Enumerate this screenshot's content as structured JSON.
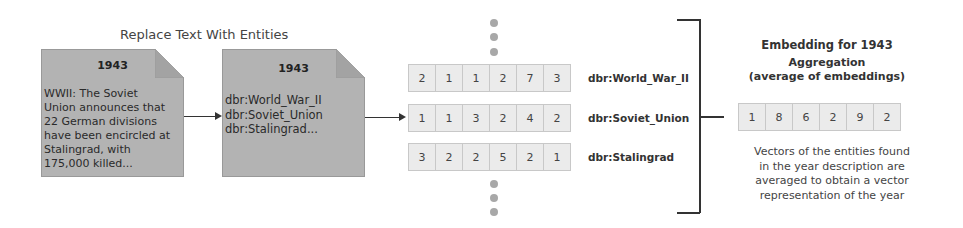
{
  "step1": {
    "title": "Replace Text With Entities",
    "source_doc": {
      "year": "1943",
      "text_lines": [
        "WWII: The Soviet",
        "Union announces that",
        "22 German divisions",
        "have been encircled at",
        "Stalingrad, with",
        "175,000 killed..."
      ]
    },
    "entity_doc": {
      "year": "1943",
      "entity_lines": [
        "dbr:World_War_II",
        "dbr:Soviet_Union",
        "dbr:Stalingrad..."
      ]
    }
  },
  "entity_vectors": [
    {
      "label": "dbr:World_War_II",
      "values": [
        2,
        1,
        1,
        2,
        7,
        3
      ]
    },
    {
      "label": "dbr:Soviet_Union",
      "values": [
        1,
        1,
        3,
        2,
        4,
        2
      ]
    },
    {
      "label": "dbr:Stalingrad",
      "values": [
        3,
        2,
        2,
        5,
        2,
        1
      ]
    }
  ],
  "ellipsis_top": "⋮",
  "ellipsis_bottom": "⋮",
  "aggregation": {
    "title_line1": "Embedding for 1943",
    "title_line2": "Aggregation",
    "title_line3": "(average of embeddings)",
    "result_vector": [
      1,
      8,
      6,
      2,
      9,
      2
    ],
    "description_lines": [
      "Vectors of the entities found",
      "in the year description are",
      "averaged to obtain a vector",
      "representation of the year"
    ]
  },
  "colors": {
    "doc_fill": "#b3b3b3",
    "cell_fill": "#ebebeb",
    "cell_border": "#c8c8c8",
    "dot": "#a8a8a8",
    "line": "#333333"
  }
}
